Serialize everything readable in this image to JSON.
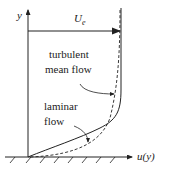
{
  "diagram": {
    "axis_y_label": "y",
    "axis_x_label": "u(y)",
    "freestream_label": "U",
    "freestream_sub": "e",
    "turbulent_label_line1": "turbulent",
    "turbulent_label_line2": "mean flow",
    "laminar_label_line1": "laminar",
    "laminar_label_line2": "flow",
    "line_color": "#222222"
  }
}
